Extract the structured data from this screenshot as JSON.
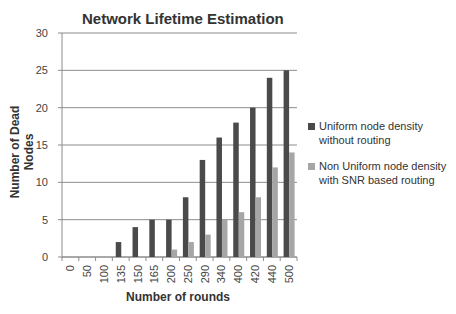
{
  "chart_data": {
    "type": "bar",
    "title": "Network Lifetime Estimation",
    "xlabel": "Number of rounds",
    "ylabel": "Number of Dead Nodes",
    "ylim": [
      0,
      30
    ],
    "yticks": [
      0,
      5,
      10,
      15,
      20,
      25,
      30
    ],
    "grid": true,
    "legend_position": "right",
    "categories": [
      "0",
      "50",
      "100",
      "135",
      "150",
      "165",
      "200",
      "250",
      "290",
      "340",
      "400",
      "420",
      "440",
      "500"
    ],
    "series": [
      {
        "name": "Uniform node density without routing",
        "color": "#4a4a4a",
        "values": [
          0,
          0,
          0,
          2,
          4,
          5,
          5,
          8,
          13,
          16,
          18,
          20,
          24,
          25
        ]
      },
      {
        "name": "Non Uniform node density with SNR based routing",
        "color": "#a6a6a6",
        "values": [
          0,
          0,
          0,
          0,
          0,
          0,
          1,
          2,
          3,
          5,
          6,
          8,
          12,
          14
        ]
      }
    ]
  },
  "labels": {
    "title": "Network Lifetime Estimation",
    "xlabel": "Number of rounds",
    "ylabel": "Number of Dead Nodes",
    "legend": [
      {
        "label_line1": "Uniform node density",
        "label_line2": "without routing"
      },
      {
        "label_line1": "Non Uniform node density",
        "label_line2": "with SNR based routing"
      }
    ]
  }
}
